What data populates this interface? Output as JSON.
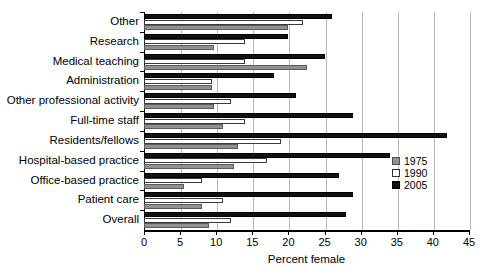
{
  "chart_data": {
    "type": "bar",
    "orientation": "horizontal",
    "title": "",
    "xlabel": "Percent female",
    "ylabel": "",
    "xlim": [
      0,
      45
    ],
    "xticks": [
      0,
      5,
      10,
      15,
      20,
      25,
      30,
      35,
      40,
      45
    ],
    "grid": true,
    "grid_axis": "x",
    "legend_position": "right",
    "categories": [
      "Other",
      "Research",
      "Medical teaching",
      "Administration",
      "Other professional activity",
      "Full-time staff",
      "Residents/fellows",
      "Hospital-based practice",
      "Office-based practice",
      "Patient care",
      "Overall"
    ],
    "series": [
      {
        "name": "1975",
        "color": "#919191",
        "values": [
          20.0,
          9.7,
          22.5,
          9.4,
          9.7,
          11.0,
          13.0,
          12.5,
          5.5,
          8.0,
          9.0
        ]
      },
      {
        "name": "1990",
        "color": "#ffffff",
        "values": [
          22.0,
          14.0,
          14.0,
          9.4,
          12.0,
          14.0,
          19.0,
          17.0,
          8.0,
          11.0,
          12.0
        ]
      },
      {
        "name": "2005",
        "color": "#111111",
        "values": [
          26.0,
          20.0,
          25.0,
          18.0,
          21.0,
          29.0,
          42.0,
          34.0,
          27.0,
          29.0,
          28.0
        ]
      }
    ]
  },
  "legend": {
    "items": [
      {
        "label": "1975",
        "swatch": "gray"
      },
      {
        "label": "1990",
        "swatch": "white"
      },
      {
        "label": "2005",
        "swatch": "black"
      }
    ]
  },
  "axis": {
    "x_tick_labels": [
      "0",
      "5",
      "10",
      "15",
      "20",
      "25",
      "30",
      "35",
      "40",
      "45"
    ],
    "x_title": "Percent female"
  }
}
